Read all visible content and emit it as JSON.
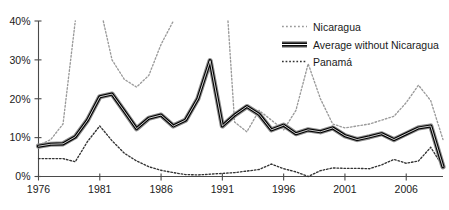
{
  "chart_data": {
    "type": "line",
    "title": "",
    "xlabel": "",
    "ylabel": "",
    "xlim": [
      1976,
      2009
    ],
    "ylim": [
      0,
      40
    ],
    "grid": false,
    "legend_position": "top-right",
    "x_tick_labels": [
      "1976",
      "1981",
      "1986",
      "1991",
      "1996",
      "2001",
      "2006"
    ],
    "x_ticks": [
      1976,
      1981,
      1986,
      1991,
      1996,
      2001,
      2006
    ],
    "y_tick_labels": [
      "0%",
      "10%",
      "20%",
      "30%",
      "40%"
    ],
    "y_ticks": [
      0,
      10,
      20,
      30,
      40
    ],
    "y_unit": "%",
    "x": [
      1976,
      1977,
      1978,
      1979,
      1980,
      1981,
      1982,
      1983,
      1984,
      1985,
      1986,
      1987,
      1988,
      1989,
      1990,
      1991,
      1992,
      1993,
      1994,
      1995,
      1996,
      1997,
      1998,
      1999,
      2000,
      2001,
      2002,
      2003,
      2004,
      2005,
      2006,
      2007,
      2008,
      2009
    ],
    "series": [
      {
        "name": "Nicaragua",
        "style": "dotted-light",
        "color": "#9a9a9a",
        "values": [
          8.0,
          9.5,
          13.5,
          40.0,
          56.0,
          44.0,
          30.0,
          25.0,
          23.0,
          26.0,
          34.0,
          40.0,
          52.0,
          60.0,
          66.0,
          62.0,
          14.0,
          11.5,
          17.0,
          14.5,
          12.0,
          17.0,
          29.0,
          20.0,
          13.5,
          12.5,
          13.0,
          13.5,
          14.5,
          15.5,
          19.0,
          23.5,
          19.5,
          9.5
        ],
        "note": "Off-scale above 40% between 1979 and 1991; only the portions below 40% are visible within the plot area."
      },
      {
        "name": "Average without Nicaragua",
        "style": "solid-thick",
        "color": "#000000",
        "values": [
          7.8,
          8.3,
          8.4,
          10.2,
          14.5,
          20.5,
          21.2,
          16.8,
          12.3,
          15.0,
          15.8,
          13.0,
          14.5,
          20.0,
          29.8,
          13.0,
          15.8,
          18.0,
          16.0,
          12.0,
          13.2,
          11.0,
          12.0,
          11.5,
          12.5,
          10.5,
          9.5,
          10.2,
          11.0,
          9.5,
          11.0,
          12.5,
          13.0,
          2.5
        ]
      },
      {
        "name": "Panamá",
        "style": "dotted-dark",
        "color": "#333333",
        "values": [
          4.6,
          4.6,
          4.6,
          3.8,
          9.0,
          13.0,
          9.2,
          6.0,
          4.0,
          2.5,
          1.6,
          1.0,
          0.5,
          0.4,
          0.6,
          0.8,
          1.0,
          1.4,
          1.8,
          3.2,
          2.0,
          1.2,
          0.0,
          1.5,
          2.2,
          2.1,
          2.1,
          2.0,
          3.0,
          4.4,
          3.4,
          4.0,
          7.5,
          2.5
        ]
      }
    ],
    "legend": [
      {
        "label": "Nicaragua",
        "style": "dotted-light"
      },
      {
        "label": "Average without Nicaragua",
        "style": "solid-thick"
      },
      {
        "label": "Panamá",
        "style": "dotted-dark"
      }
    ]
  },
  "colors": {
    "axis": "#4a4a4a",
    "text": "#1a1a1a",
    "nicaragua": "#9a9a9a",
    "average": "#000000",
    "panama": "#333333",
    "background": "#ffffff"
  }
}
